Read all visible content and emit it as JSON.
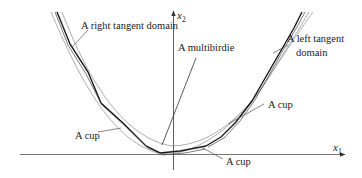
{
  "diagram": {
    "axes": {
      "x_label": "x",
      "x_subscript": "1",
      "y_label": "x",
      "y_subscript": "2"
    },
    "labels": {
      "right_tangent": "A right tangent domain",
      "multibirdie": "A multibirdie",
      "left_tangent_1": "A left tangent",
      "left_tangent_2": "domain",
      "cup_left": "A cup",
      "cup_right": "A cup",
      "cup_bottom": "A cup"
    },
    "colors": {
      "thick_line": "#1a1a1a",
      "thin_line": "#555555",
      "faint_line": "#8a8a8a",
      "axis": "#333333"
    }
  }
}
